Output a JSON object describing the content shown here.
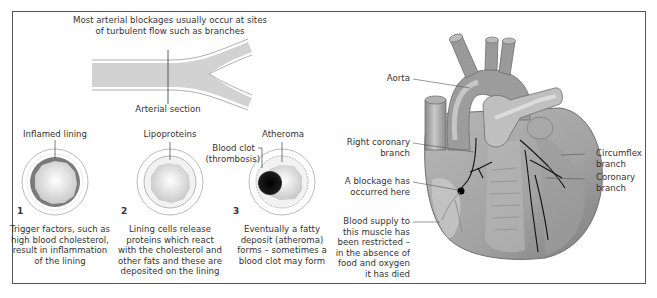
{
  "left_panel": {
    "title_line1": "Most arterial blockages usually occur at sites",
    "title_line2": "of turbulent flow such as branches",
    "artery_label": "Arterial section",
    "stages": [
      {
        "number": "1",
        "label": "Inflamed lining",
        "caption": [
          "Trigger factors, such as",
          "high blood cholesterol,",
          "result in inflammation",
          "of the lining"
        ]
      },
      {
        "number": "2",
        "label": "Lipoproteins",
        "caption": [
          "Lining cells release",
          "proteins which react",
          "with the cholesterol and",
          "other fats and these are",
          "deposited on the lining"
        ]
      },
      {
        "number": "3",
        "label": "Atheroma",
        "label2_line1": "Blood clot",
        "label2_line2": "(thrombosis)",
        "caption": [
          "Eventually a fatty",
          "deposit (atheroma)",
          "forms – sometimes a",
          "blood clot may form"
        ]
      }
    ]
  },
  "right_panel": {
    "labels": {
      "aorta": "Aorta",
      "right_coronary_1": "Right coronary",
      "right_coronary_2": "branch",
      "blockage_1": "A blockage has",
      "blockage_2": "occurred here",
      "blood_supply": [
        "Blood supply to",
        "this muscle has",
        "been restricted –",
        "in the absence of",
        "food and oxygen",
        "it has died"
      ],
      "circumflex_1": "Circumflex",
      "circumflex_2": "branch",
      "coronary_1": "Coronary",
      "coronary_2": "branch"
    }
  },
  "colors": {
    "frame": "#555555",
    "artery_fill": "#cfcfcf",
    "inflamed": "#777777",
    "clot": "#111111",
    "heart_mid": "#9a9a9a",
    "heart_light": "#c8c8c8",
    "heart_dark": "#6e6e6e"
  }
}
